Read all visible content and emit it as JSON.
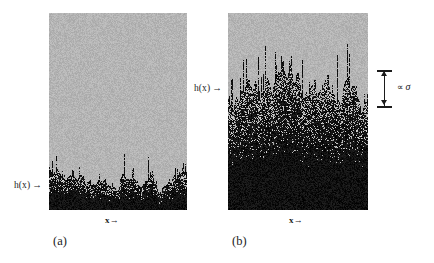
{
  "figure": {
    "type": "scientific-illustration",
    "background_color": "#ffffff",
    "panels": [
      {
        "id": "a",
        "caption": "(a)",
        "x_axis_label": "x→",
        "interface_label": "h(x)",
        "interface_arrow": "→",
        "substrate_color": "#b9b9b9",
        "deposit_color": "#111111",
        "note": "early time: thin deposit, small interface width"
      },
      {
        "id": "b",
        "caption": "(b)",
        "x_axis_label": "x→",
        "interface_label": "h(x)",
        "interface_arrow": "→",
        "substrate_color": "#b9b9b9",
        "deposit_color": "#111111",
        "note": "later time: thick deposit, larger interface width"
      }
    ],
    "annotation": {
      "proportional_symbol": "∝",
      "sigma_symbol": "σ",
      "full_text": "∝ σ",
      "target_panel": "b",
      "marker": "double-headed-vertical-arrow"
    }
  },
  "chart_data": {
    "type": "area",
    "title": "",
    "xlabel": "x→",
    "ylabel": "h(x)",
    "grid": false,
    "legend": false,
    "panels": [
      {
        "name": "(a)",
        "x_range": [
          0,
          1
        ],
        "y_range": [
          0,
          1
        ],
        "mean_height": 0.17,
        "interface_width_sigma": 0.045,
        "description": "Deposit occupies lowest ~17% of the box; jagged black interface with short spikes against light gray background."
      },
      {
        "name": "(b)",
        "x_range": [
          0,
          1
        ],
        "y_range": [
          0,
          1
        ],
        "mean_height": 0.58,
        "interface_width_sigma": 0.1,
        "description": "Deposit occupies lowest ~58% of the box; interface is rougher and wider, density increases downward from sparse near h(x) to solid black at base."
      }
    ],
    "annotations": [
      {
        "text": "h(x)",
        "panel": "a",
        "points_to": "interface"
      },
      {
        "text": "h(x)",
        "panel": "b",
        "points_to": "interface"
      },
      {
        "text": "∝ σ",
        "panel": "b",
        "points_to": "interface-width-bar"
      }
    ]
  }
}
